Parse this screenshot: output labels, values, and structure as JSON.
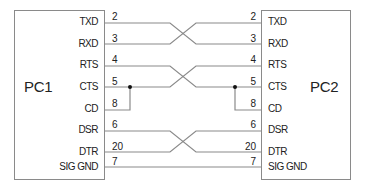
{
  "diagram": {
    "title": "",
    "devices": [
      {
        "id": "pc1",
        "label": "PC1"
      },
      {
        "id": "pc2",
        "label": "PC2"
      }
    ],
    "signals": [
      {
        "name": "TXD",
        "pin_left": "2",
        "pin_right": "2"
      },
      {
        "name": "RXD",
        "pin_left": "3",
        "pin_right": "3"
      },
      {
        "name": "RTS",
        "pin_left": "4",
        "pin_right": "4"
      },
      {
        "name": "CTS",
        "pin_left": "5",
        "pin_right": "5"
      },
      {
        "name": "CD",
        "pin_left": "8",
        "pin_right": "8"
      },
      {
        "name": "DSR",
        "pin_left": "6",
        "pin_right": "6"
      },
      {
        "name": "DTR",
        "pin_left": "20",
        "pin_right": "20"
      },
      {
        "name": "SIG GND",
        "pin_left": "7",
        "pin_right": "7"
      }
    ],
    "connections": [
      {
        "from": "PC1.TXD",
        "to": "PC2.RXD",
        "type": "crossed"
      },
      {
        "from": "PC1.RXD",
        "to": "PC2.TXD",
        "type": "crossed"
      },
      {
        "from": "PC1.RTS",
        "to": "PC2.CTS",
        "type": "crossed"
      },
      {
        "from": "PC1.CTS",
        "to": "PC2.RTS",
        "type": "crossed"
      },
      {
        "from": "PC1.CTS",
        "to": "PC1.CD",
        "type": "local-jumper"
      },
      {
        "from": "PC2.CTS",
        "to": "PC2.CD",
        "type": "local-jumper"
      },
      {
        "from": "PC1.DSR",
        "to": "PC2.DTR",
        "type": "crossed"
      },
      {
        "from": "PC1.DTR",
        "to": "PC2.DSR",
        "type": "crossed"
      },
      {
        "from": "PC1.SIG GND",
        "to": "PC2.SIG GND",
        "type": "straight"
      }
    ],
    "colors": {
      "line": "#8a8a8a",
      "text": "#222222",
      "junction": "#111111"
    }
  }
}
